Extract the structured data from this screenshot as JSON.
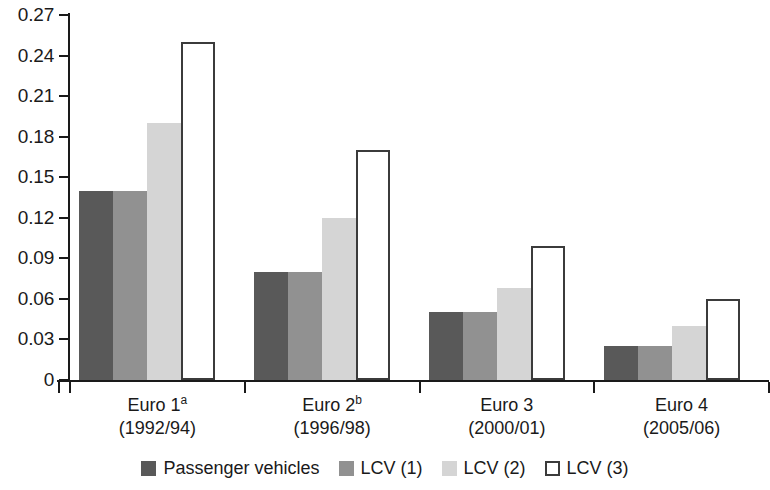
{
  "chart_data": {
    "type": "bar",
    "title": "",
    "subtitle": "",
    "xlabel": "",
    "ylabel": "",
    "ylim": [
      0,
      0.27
    ],
    "grid": false,
    "legend_position": "bottom-center",
    "y_ticks": [
      "0",
      "0.03",
      "0.06",
      "0.09",
      "0.12",
      "0.15",
      "0.18",
      "0.21",
      "0.24",
      "0.27"
    ],
    "y_tick_values": [
      0,
      0.03,
      0.06,
      0.09,
      0.12,
      0.15,
      0.18,
      0.21,
      0.24,
      0.27
    ],
    "categories": [
      "Euro 1",
      "Euro 2",
      "Euro 3",
      "Euro 4"
    ],
    "category_superscripts": [
      "a",
      "b",
      "",
      ""
    ],
    "category_years": [
      "(1992/94)",
      "(1996/98)",
      "(2000/01)",
      "(2005/06)"
    ],
    "series": [
      {
        "name": "Passenger vehicles",
        "color": "#595959",
        "style": "filled",
        "values": [
          0.14,
          0.08,
          0.05,
          0.025
        ]
      },
      {
        "name": "LCV (1)",
        "color": "#919191",
        "style": "filled",
        "values": [
          0.14,
          0.08,
          0.05,
          0.025
        ]
      },
      {
        "name": "LCV (2)",
        "color": "#d5d5d5",
        "style": "filled",
        "values": [
          0.19,
          0.12,
          0.068,
          0.04
        ]
      },
      {
        "name": "LCV (3)",
        "color": "#ffffff",
        "style": "outlined",
        "values": [
          0.25,
          0.17,
          0.099,
          0.06
        ]
      }
    ]
  },
  "axis": {
    "y_labels": [
      "0.27",
      "0.24",
      "0.21",
      "0.18",
      "0.15",
      "0.12",
      "0.09",
      "0.06",
      "0.03",
      "0"
    ]
  },
  "groups": [
    {
      "name": "Euro 1",
      "superscript": "a",
      "years": "(1992/94)"
    },
    {
      "name": "Euro 2",
      "superscript": "b",
      "years": "(1996/98)"
    },
    {
      "name": "Euro 3",
      "superscript": "",
      "years": "(2000/01)"
    },
    {
      "name": "Euro 4",
      "superscript": "",
      "years": "(2005/06)"
    }
  ],
  "legend": {
    "items": [
      {
        "label": "Passenger vehicles",
        "swatch": "dark-gray-swatch",
        "fill": "f-dark"
      },
      {
        "label": "LCV (1)",
        "swatch": "medium-gray-swatch",
        "fill": "f-med"
      },
      {
        "label": "LCV (2)",
        "swatch": "light-gray-swatch",
        "fill": "f-light"
      },
      {
        "label": "LCV (3)",
        "swatch": "white-outline-swatch",
        "fill": "f-white"
      }
    ]
  },
  "colors": {
    "series_1": "#595959",
    "series_2": "#919191",
    "series_3": "#d5d5d5",
    "series_4": "#ffffff",
    "axis": "#1a1a1a",
    "background": "#ffffff"
  }
}
